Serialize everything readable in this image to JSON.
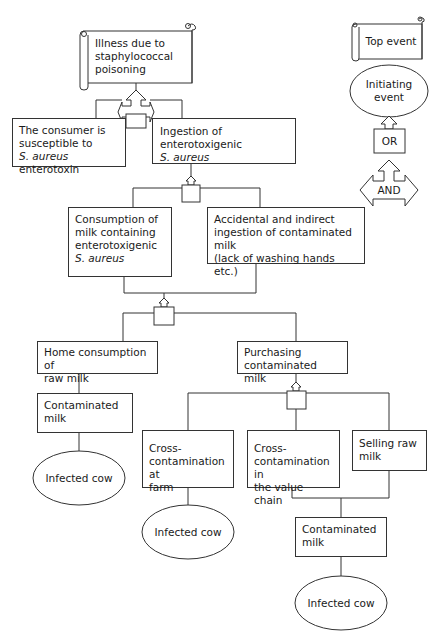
{
  "diagram": {
    "type": "fault-tree",
    "top_event": {
      "line1": "Illness due to",
      "line2": "staphylococcal",
      "line3": "poisoning"
    },
    "level1": {
      "left": {
        "line1": "The consumer is",
        "line2": "susceptible to",
        "italic": "S. aureus",
        "rest": " enterotoxin"
      },
      "right": {
        "line1": "Ingestion of enterotoxigenic",
        "italic": "S. aureus"
      }
    },
    "level2": {
      "left": {
        "line1": "Consumption of",
        "line2": "milk containing",
        "line3": "enterotoxigenic",
        "italic": "S. aureus"
      },
      "right": {
        "line1": "Accidental and indirect",
        "line2": "ingestion of contaminated milk",
        "line3": "(lack of washing hands etc.)"
      }
    },
    "level3": {
      "left": {
        "line1": "Home consumption of",
        "line2": "raw milk"
      },
      "right": {
        "line1": "Purchasing",
        "line2": "contaminated milk"
      }
    },
    "level4": {
      "home_contaminated": {
        "line1": "Contaminated",
        "line2": "milk"
      },
      "cross_farm": {
        "line1": "Cross-",
        "line2": "contamination at",
        "line3": "farm"
      },
      "cross_chain": {
        "line1": "Cross-",
        "line2": "contamination in",
        "line3": "the value chain"
      },
      "selling": {
        "line1": "Selling raw",
        "line2": "milk"
      }
    },
    "level5": {
      "contaminated": {
        "line1": "Contaminated",
        "line2": "milk"
      }
    },
    "initiating_events": {
      "home": "Infected cow",
      "farm": "Infected cow",
      "chain": "Infected cow"
    },
    "legend": {
      "top_event": "Top event",
      "initiating_line1": "Initiating",
      "initiating_line2": "event",
      "or": "OR",
      "and": "AND"
    },
    "colors": {
      "stroke": "#333333",
      "fill": "#ffffff",
      "text": "#1a1a1a"
    }
  }
}
